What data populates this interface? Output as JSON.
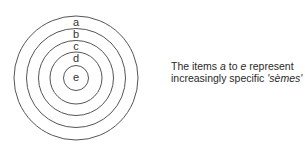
{
  "diagram": {
    "rings": [
      {
        "label": "a",
        "r": 62
      },
      {
        "label": "b",
        "r": 49.5
      },
      {
        "label": "c",
        "r": 37.5
      },
      {
        "label": "d",
        "r": 26
      },
      {
        "label": "e",
        "r": 12.5
      }
    ],
    "center": {
      "x": 76,
      "y": 78
    },
    "stroke_color": "#555555"
  },
  "caption": {
    "line1_pre": "The items ",
    "item_from": "a",
    "line1_mid": " to ",
    "item_to": "e",
    "line1_post": " represent",
    "line2_pre": "increasingly specific ",
    "term": "'sèmes'"
  }
}
